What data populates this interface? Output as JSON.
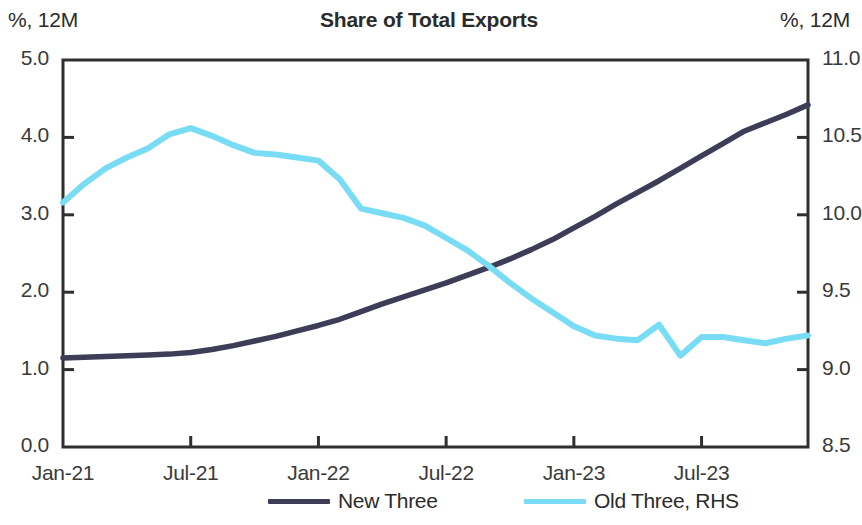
{
  "header": {
    "title": "Share of Total Exports",
    "unit_left": "%, 12M",
    "unit_right": "%, 12M"
  },
  "legend": {
    "items": [
      {
        "label": "New Three",
        "color": "#3d3d57"
      },
      {
        "label": "Old Three, RHS",
        "color": "#79dcf5"
      }
    ]
  },
  "chart_data": {
    "type": "line",
    "title": "Share of Total Exports",
    "xlabel": "",
    "ylabel": "%, 12M",
    "ylabel_right": "%, 12M",
    "grid": false,
    "legend_position": "bottom",
    "x_tick_labels": [
      "Jan-21",
      "Jul-21",
      "Jan-22",
      "Jul-22",
      "Jan-23",
      "Jul-23"
    ],
    "x_tick_values": [
      0,
      6,
      12,
      18,
      24,
      30
    ],
    "xlim": [
      0,
      35
    ],
    "ylim": [
      0.0,
      5.0
    ],
    "y_tick_labels": [
      "0.0",
      "1.0",
      "2.0",
      "3.0",
      "4.0",
      "5.0"
    ],
    "y_tick_values": [
      0.0,
      1.0,
      2.0,
      3.0,
      4.0,
      5.0
    ],
    "ylim_right": [
      8.5,
      11.0
    ],
    "y_tick_labels_right": [
      "8.5",
      "9.0",
      "9.5",
      "10.0",
      "10.5",
      "11.0"
    ],
    "y_tick_values_right": [
      8.5,
      9.0,
      9.5,
      10.0,
      10.5,
      11.0
    ],
    "x": [
      0,
      1,
      2,
      3,
      4,
      5,
      6,
      7,
      8,
      9,
      10,
      11,
      12,
      13,
      14,
      15,
      16,
      17,
      18,
      19,
      20,
      21,
      22,
      23,
      24,
      25,
      26,
      27,
      28,
      29,
      30,
      31,
      32,
      33,
      34,
      35
    ],
    "series": [
      {
        "name": "New Three",
        "color": "#3d3d57",
        "axis": "left",
        "values": [
          1.15,
          1.16,
          1.17,
          1.18,
          1.19,
          1.2,
          1.22,
          1.26,
          1.31,
          1.37,
          1.43,
          1.5,
          1.57,
          1.65,
          1.75,
          1.85,
          1.94,
          2.03,
          2.12,
          2.22,
          2.32,
          2.43,
          2.55,
          2.68,
          2.83,
          2.98,
          3.14,
          3.29,
          3.44,
          3.6,
          3.76,
          3.92,
          4.08,
          4.19,
          4.3,
          4.42
        ]
      },
      {
        "name": "Old Three, RHS",
        "color": "#79dcf5",
        "axis": "right",
        "values": [
          10.08,
          10.2,
          10.3,
          10.37,
          10.43,
          10.52,
          10.56,
          10.51,
          10.45,
          10.4,
          10.39,
          10.37,
          10.35,
          10.23,
          10.04,
          10.01,
          9.98,
          9.93,
          9.85,
          9.77,
          9.67,
          9.56,
          9.46,
          9.37,
          9.28,
          9.22,
          9.2,
          9.19,
          9.29,
          9.09,
          9.21,
          9.21,
          9.19,
          9.17,
          9.2,
          9.22
        ]
      }
    ]
  }
}
